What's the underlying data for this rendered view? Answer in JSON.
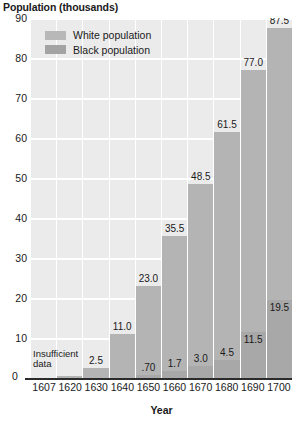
{
  "chart_data": {
    "type": "bar",
    "subtype": "stacked-bar",
    "title": "",
    "ylabel": "Population (thousands)",
    "xlabel": "Year",
    "ylim": [
      0,
      90
    ],
    "ytick_step": 10,
    "yticks": [
      0,
      10,
      20,
      30,
      40,
      50,
      60,
      70,
      80,
      90
    ],
    "grid": true,
    "grid_color": "#ffffff",
    "plot_background": "#ebebeb",
    "legend_position": "upper-left-inside",
    "categories": [
      "1607",
      "1620",
      "1630",
      "1640",
      "1650",
      "1660",
      "1670",
      "1680",
      "1690",
      "1700"
    ],
    "series": [
      {
        "name": "White population",
        "color": "#b4b4b4",
        "values": [
          null,
          0.5,
          2.5,
          11.0,
          23.0,
          35.5,
          48.5,
          61.5,
          77.0,
          87.5
        ],
        "labels": [
          "",
          "",
          "2.5",
          "11.0",
          "23.0",
          "35.5",
          "48.5",
          "61.5",
          "77.0",
          "87.5"
        ]
      },
      {
        "name": "Black population",
        "color": "#a8a8a8",
        "values": [
          null,
          null,
          null,
          null,
          0.7,
          1.7,
          3.0,
          4.5,
          11.5,
          19.5
        ],
        "labels": [
          "",
          "",
          "",
          "",
          ".70",
          "1.7",
          "3.0",
          "4.5",
          "11.5",
          "19.5"
        ]
      }
    ],
    "annotations": [
      {
        "name": "insufficient-data-note",
        "text_line1": "Insufficient",
        "text_line2": "data",
        "applies_to": "1607"
      }
    ]
  },
  "legend": {
    "items": [
      {
        "label": "White population",
        "swatch": "#b8b8b8"
      },
      {
        "label": "Black population",
        "swatch": "#a3a3a3"
      }
    ]
  },
  "axes": {
    "y_title": "Population (thousands)",
    "x_title": "Year",
    "zero_label": "0"
  }
}
